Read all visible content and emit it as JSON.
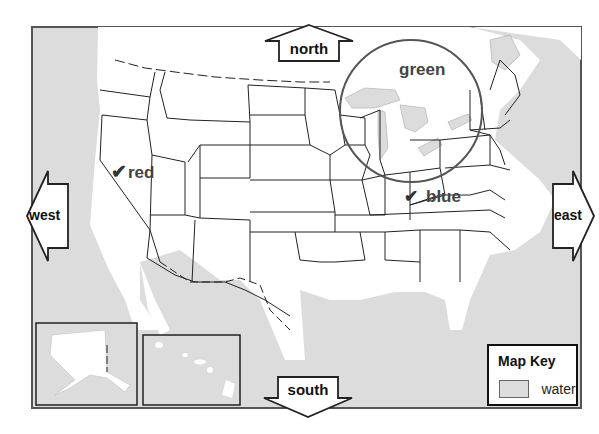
{
  "map": {
    "water_color": "#dcdcdc",
    "land_color": "#ffffff",
    "border_color": "#333333"
  },
  "directions": {
    "north": "north",
    "south": "south",
    "east": "east",
    "west": "west"
  },
  "markers": {
    "red": {
      "check": "✔",
      "label": "red"
    },
    "blue": {
      "check": "✔",
      "label": "blue"
    },
    "green": {
      "label": "green"
    }
  },
  "map_key": {
    "title": "Map Key",
    "items": [
      {
        "label": "water",
        "swatch_color": "#dcdcdc"
      }
    ]
  },
  "insets": [
    {
      "name": "alaska"
    },
    {
      "name": "hawaii"
    }
  ]
}
